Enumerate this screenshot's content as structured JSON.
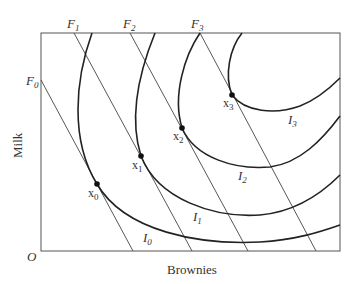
{
  "diagram": {
    "type": "indifference-curves-with-budget-lines",
    "axes": {
      "x_label": "Brownies",
      "y_label": "Milk",
      "origin_label": "O"
    },
    "budget_lines": [
      {
        "label": "F",
        "sub": "0"
      },
      {
        "label": "F",
        "sub": "1"
      },
      {
        "label": "F",
        "sub": "2"
      },
      {
        "label": "F",
        "sub": "3"
      }
    ],
    "indifference_curves": [
      {
        "label": "I",
        "sub": "0"
      },
      {
        "label": "I",
        "sub": "1"
      },
      {
        "label": "I",
        "sub": "2"
      },
      {
        "label": "I",
        "sub": "3"
      }
    ],
    "points": [
      {
        "label": "x",
        "sub": "0"
      },
      {
        "label": "x",
        "sub": "1"
      },
      {
        "label": "x",
        "sub": "2"
      },
      {
        "label": "x",
        "sub": "3"
      }
    ],
    "colors": {
      "frame": "#555555",
      "curve": "#222222",
      "budget_line": "#444444"
    }
  }
}
